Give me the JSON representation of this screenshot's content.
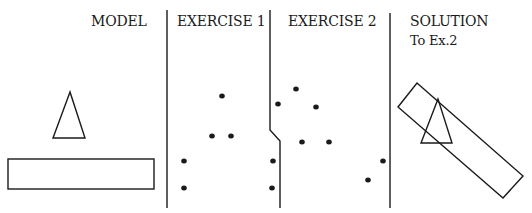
{
  "panels": [
    {
      "id": "model",
      "title": "MODEL"
    },
    {
      "id": "exercise1",
      "title": "EXERCISE 1"
    },
    {
      "id": "exercise2",
      "title": "EXERCISE 2"
    },
    {
      "id": "solution",
      "title": "SOLUTION",
      "subtitle": "To Ex.2"
    }
  ],
  "colors": {
    "stroke": "#1a1a1a",
    "background": "#ffffff"
  },
  "shapes": {
    "model_triangle": [
      [
        70,
        92
      ],
      [
        53,
        138
      ],
      [
        85,
        138
      ]
    ],
    "model_rectangle": {
      "x": 8,
      "y": 159,
      "width": 146,
      "height": 30
    },
    "solution_rectangle": [
      [
        417,
        83
      ],
      [
        523,
        176
      ],
      [
        503,
        198
      ],
      [
        398,
        107
      ]
    ],
    "solution_triangle": [
      [
        438,
        99
      ],
      [
        421,
        143
      ],
      [
        452,
        143
      ]
    ]
  },
  "dividers": [
    {
      "points": [
        [
          167,
          10
        ],
        [
          167,
          208
        ]
      ]
    },
    {
      "points": [
        [
          270,
          10
        ],
        [
          270,
          130
        ],
        [
          280,
          141
        ],
        [
          280,
          208
        ]
      ]
    },
    {
      "points": [
        [
          390,
          13
        ],
        [
          390,
          208
        ]
      ]
    }
  ],
  "dots": {
    "exercise1": [
      [
        222,
        96
      ],
      [
        212,
        136
      ],
      [
        231,
        136
      ],
      [
        184,
        161
      ],
      [
        184,
        188
      ],
      [
        273,
        161
      ],
      [
        272,
        188
      ]
    ],
    "exercise2": [
      [
        296,
        89
      ],
      [
        278,
        104
      ],
      [
        316,
        107
      ],
      [
        302,
        142
      ],
      [
        329,
        142
      ],
      [
        383,
        161
      ],
      [
        368,
        180
      ]
    ]
  }
}
